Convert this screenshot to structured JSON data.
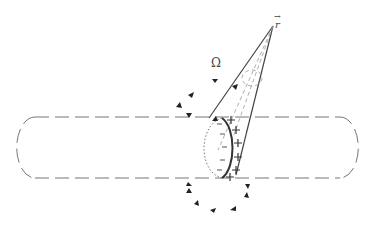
{
  "figure": {
    "type": "physics-diagram",
    "labels": {
      "point": "r",
      "point_vector_mark": "→",
      "solid_angle": "Ω",
      "plus_sign": "+",
      "minus_sign": "-"
    },
    "colors": {
      "line": "#555555",
      "dashed": "#777777",
      "background": "#ffffff"
    }
  }
}
